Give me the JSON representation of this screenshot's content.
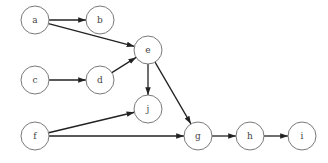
{
  "diagram": {
    "type": "directed-graph",
    "nodes": [
      {
        "id": "a",
        "label": "a",
        "x": 35,
        "y": 20
      },
      {
        "id": "b",
        "label": "b",
        "x": 100,
        "y": 20
      },
      {
        "id": "c",
        "label": "c",
        "x": 35,
        "y": 80
      },
      {
        "id": "d",
        "label": "d",
        "x": 100,
        "y": 80
      },
      {
        "id": "e",
        "label": "e",
        "x": 148,
        "y": 50
      },
      {
        "id": "j",
        "label": "j",
        "x": 148,
        "y": 109
      },
      {
        "id": "f",
        "label": "f",
        "x": 35,
        "y": 136
      },
      {
        "id": "g",
        "label": "g",
        "x": 198,
        "y": 136
      },
      {
        "id": "h",
        "label": "h",
        "x": 250,
        "y": 136
      },
      {
        "id": "i",
        "label": "i",
        "x": 302,
        "y": 136
      }
    ],
    "edges": [
      {
        "from": "a",
        "to": "b"
      },
      {
        "from": "a",
        "to": "e"
      },
      {
        "from": "c",
        "to": "d"
      },
      {
        "from": "d",
        "to": "e"
      },
      {
        "from": "e",
        "to": "j"
      },
      {
        "from": "e",
        "to": "g"
      },
      {
        "from": "f",
        "to": "j"
      },
      {
        "from": "f",
        "to": "g"
      },
      {
        "from": "g",
        "to": "h"
      },
      {
        "from": "h",
        "to": "i"
      }
    ],
    "node_radius": 14
  }
}
